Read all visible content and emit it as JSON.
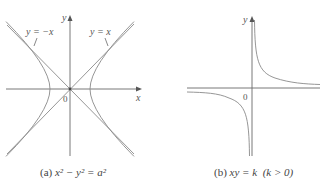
{
  "figure_a": {
    "caption_prefix": "(a)",
    "caption_equation": "x² − y² = a²",
    "axis_x_label": "x",
    "axis_y_label": "y",
    "origin_label": "0",
    "asymptote_labels": [
      "y = −x",
      "y = x"
    ]
  },
  "figure_b": {
    "caption_prefix": "(b)",
    "caption_equation": "xy = k",
    "caption_condition": "(k > 0)",
    "axis_y_label": "y",
    "origin_label": "0"
  },
  "colors": {
    "curve": "#8a8a8a",
    "axis": "#6a6a6a",
    "text": "#555555"
  }
}
